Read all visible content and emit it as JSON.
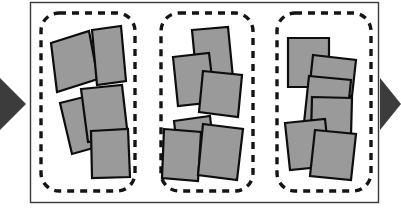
{
  "figure": {
    "title": "",
    "background_color": "#ffffff",
    "width": 401,
    "height": 208
  },
  "style": {
    "frame_stroke": "#3a3a3a",
    "frame_fill": "#ffffff",
    "frame_stroke_width": 1.4,
    "group_dash_stroke": "#141414",
    "group_dash_width": 3.4,
    "group_dash_pattern": "7 6",
    "group_corner_radius": 18,
    "tile_fill": "#9a9a9a",
    "tile_stroke": "#0d0d0d",
    "tile_stroke_width": 2.2,
    "arrow_fill": "#3c3c3c"
  },
  "arrows": {
    "left": {
      "label": "input-arrow",
      "points": "0,78 26,104 0,130",
      "direction": "right"
    },
    "right": {
      "label": "output-arrow",
      "points": "380,78 401,104 380,130",
      "direction": "right"
    }
  },
  "frame": {
    "label": "outer-frame",
    "x": 30,
    "y": 2,
    "width": 348,
    "height": 200
  },
  "groups": [
    {
      "id": "group-1",
      "label": "cluster-1",
      "tile_count": 4,
      "box": {
        "x": 41,
        "y": 13,
        "width": 94,
        "height": 178
      },
      "tiles": [
        {
          "id": "g1-t1",
          "points": "51,43 89,31 98,79 57,92"
        },
        {
          "id": "g1-t2",
          "points": "92,30 121,26 126,81 97,85"
        },
        {
          "id": "g1-t3",
          "points": "60,103 100,93 111,143 72,154"
        },
        {
          "id": "g1-t4",
          "points": "81,89 122,85 128,137 88,142"
        },
        {
          "id": "g1-t5",
          "points": "91,131 128,129 130,177 92,178"
        }
      ]
    },
    {
      "id": "group-2",
      "label": "cluster-2",
      "tile_count": 6,
      "box": {
        "x": 161,
        "y": 13,
        "width": 92,
        "height": 178
      },
      "tiles": [
        {
          "id": "g2-t1",
          "points": "192,30 228,27 233,78 197,82"
        },
        {
          "id": "g2-t2",
          "points": "173,57 209,53 215,102 178,106"
        },
        {
          "id": "g2-t3",
          "points": "203,71 242,75 238,117 199,112"
        },
        {
          "id": "g2-t4",
          "points": "174,121 210,116 215,160 179,165"
        },
        {
          "id": "g2-t5",
          "points": "164,129 201,132 198,181 162,178"
        },
        {
          "id": "g2-t6",
          "points": "203,124 243,129 237,180 198,175"
        }
      ]
    },
    {
      "id": "group-3",
      "label": "cluster-3",
      "tile_count": 6,
      "box": {
        "x": 277,
        "y": 13,
        "width": 94,
        "height": 178
      },
      "tiles": [
        {
          "id": "g3-t1",
          "points": "288,38 329,38 329,87 288,87"
        },
        {
          "id": "g3-t2",
          "points": "313,55 356,60 352,96 309,92"
        },
        {
          "id": "g3-t3",
          "points": "309,76 351,80 346,128 304,123"
        },
        {
          "id": "g3-t4",
          "points": "312,97 352,98 351,135 311,134"
        },
        {
          "id": "g3-t5",
          "points": "285,123 325,119 330,166 290,170"
        },
        {
          "id": "g3-t6",
          "points": "315,130 356,134 351,180 310,176"
        }
      ]
    }
  ],
  "semantics": {
    "diagram_type": "grouped-scattered-tiles",
    "description": "Three dashed rounded-rectangle groups inside a rectangular frame, each containing overlapping rotated gray squares, with arrows entering at left and exiting at right."
  }
}
